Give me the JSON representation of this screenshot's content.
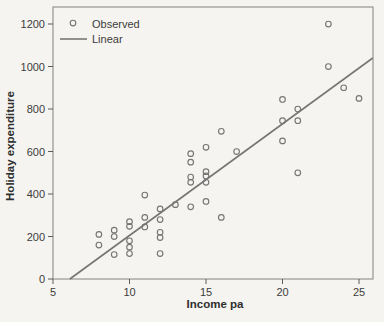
{
  "figure": {
    "background": "#f5f4f0",
    "marker_line_color": "#767676",
    "text_color": "#3c3c3c"
  },
  "chart_data": {
    "type": "scatter",
    "title": "",
    "xlabel": "Income pa",
    "ylabel": "Holiday expenditure",
    "xlim": [
      5,
      26
    ],
    "ylim": [
      0,
      1285
    ],
    "x_ticks": [
      5,
      10,
      15,
      20,
      25
    ],
    "y_ticks": [
      0,
      200,
      400,
      600,
      800,
      1000,
      1200
    ],
    "grid": false,
    "legend": {
      "position": "top-left",
      "entries": [
        {
          "label": "Observed",
          "marker": "open-circle"
        },
        {
          "label": "Linear",
          "marker": "line"
        }
      ]
    },
    "series": [
      {
        "name": "Observed",
        "type": "scatter",
        "points": [
          [
            8,
            210
          ],
          [
            8,
            160
          ],
          [
            9,
            230
          ],
          [
            9,
            200
          ],
          [
            9,
            115
          ],
          [
            10,
            270
          ],
          [
            10,
            248
          ],
          [
            10,
            180
          ],
          [
            10,
            150
          ],
          [
            10,
            120
          ],
          [
            11,
            395
          ],
          [
            11,
            290
          ],
          [
            11,
            245
          ],
          [
            12,
            330
          ],
          [
            12,
            280
          ],
          [
            12,
            220
          ],
          [
            12,
            195
          ],
          [
            12,
            120
          ],
          [
            13,
            350
          ],
          [
            14,
            590
          ],
          [
            14,
            550
          ],
          [
            14,
            480
          ],
          [
            14,
            455
          ],
          [
            14,
            340
          ],
          [
            15,
            620
          ],
          [
            15,
            505
          ],
          [
            15,
            485
          ],
          [
            15,
            455
          ],
          [
            15,
            365
          ],
          [
            16,
            695
          ],
          [
            16,
            290
          ],
          [
            17,
            600
          ],
          [
            20,
            845
          ],
          [
            20,
            745
          ],
          [
            20,
            650
          ],
          [
            21,
            800
          ],
          [
            21,
            745
          ],
          [
            21,
            500
          ],
          [
            23,
            1200
          ],
          [
            23,
            1000
          ],
          [
            24,
            900
          ],
          [
            25,
            850
          ]
        ]
      },
      {
        "name": "Linear",
        "type": "line",
        "x1": 6.1,
        "y1": 0,
        "x2": 25.9,
        "y2": 1040
      }
    ]
  }
}
